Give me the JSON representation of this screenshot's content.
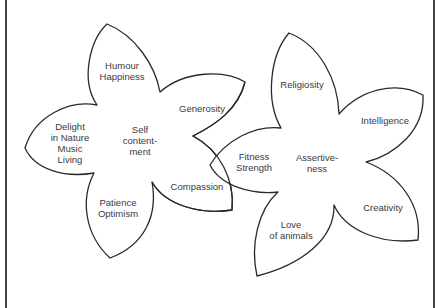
{
  "diagram": {
    "type": "two overlapping flower diagrams",
    "flowers": [
      {
        "id": "left",
        "center_label": "Self\ncontent-\nment",
        "petals": [
          {
            "label": "Humour\nHappiness"
          },
          {
            "label": "Generosity"
          },
          {
            "label": "Compassion"
          },
          {
            "label": "Patience\nOptimism"
          },
          {
            "label": "Delight\nin Nature\nMusic\nLiving"
          }
        ]
      },
      {
        "id": "right",
        "center_label": "Assertive-\nness",
        "petals": [
          {
            "label": "Religiosity"
          },
          {
            "label": "Intelligence"
          },
          {
            "label": "Creativity"
          },
          {
            "label": "Love\nof animals"
          },
          {
            "label": "Fitness\nStrength"
          }
        ]
      }
    ],
    "colors": {
      "outline": "#2a2a2a",
      "text": "#3a3a3a",
      "background": "#ffffff",
      "frame": "#444444"
    }
  }
}
